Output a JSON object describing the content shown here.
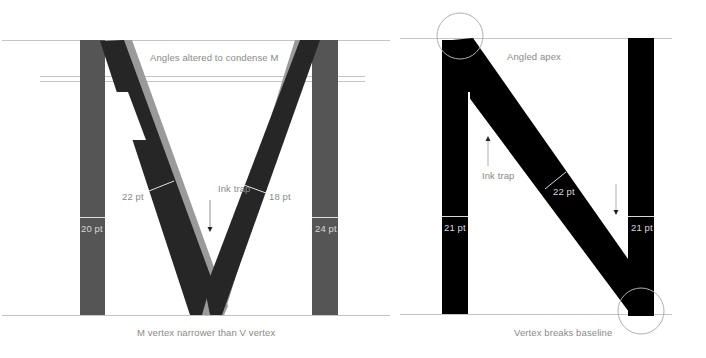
{
  "figure": {
    "type": "typography-anatomy-diagram",
    "letters": [
      "M",
      "N"
    ]
  },
  "letter_m": {
    "top_caption": "Angles altered to condense M",
    "bottom_caption": "M vertex narrower than V vertex",
    "ink_trap_label": "Ink trap",
    "measurements": {
      "left_stem": "20 pt",
      "right_stem": "24 pt",
      "left_diagonal": "22 pt",
      "right_diagonal": "18 pt"
    },
    "colors": {
      "stems": "#555555",
      "diagonals": "#262626",
      "v_overlay": "#9a9a9a"
    }
  },
  "letter_n": {
    "top_caption": "Angled apex",
    "bottom_caption": "Vertex breaks baseline",
    "ink_trap_label": "Ink trap",
    "measurements": {
      "left_stem": "21 pt",
      "right_stem": "21 pt",
      "diagonal": "22 pt"
    },
    "colors": {
      "fill": "#000000",
      "highlight_circle": "#b0b0b0"
    }
  },
  "guides": {
    "line_color": "#c4c4c4"
  }
}
